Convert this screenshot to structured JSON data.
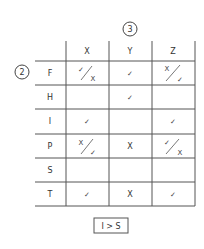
{
  "column_group_label": "3",
  "row_group_label": "2",
  "columns": [
    "X",
    "Y",
    "Z"
  ],
  "rows": [
    {
      "label": "F",
      "cells": [
        {
          "type": "split",
          "top": "✓",
          "bottom": "X"
        },
        {
          "type": "single",
          "value": "✓"
        },
        {
          "type": "split",
          "top": "X",
          "bottom": "✓"
        }
      ]
    },
    {
      "label": "H",
      "cells": [
        {
          "type": "empty"
        },
        {
          "type": "single",
          "value": "✓"
        },
        {
          "type": "empty"
        }
      ]
    },
    {
      "label": "I",
      "cells": [
        {
          "type": "single",
          "value": "✓"
        },
        {
          "type": "empty"
        },
        {
          "type": "single",
          "value": "✓"
        }
      ]
    },
    {
      "label": "P",
      "cells": [
        {
          "type": "split",
          "top": "X",
          "bottom": "✓"
        },
        {
          "type": "single",
          "value": "X"
        },
        {
          "type": "split",
          "top": "✓",
          "bottom": "X"
        }
      ]
    },
    {
      "label": "S",
      "cells": [
        {
          "type": "empty"
        },
        {
          "type": "empty"
        },
        {
          "type": "empty"
        }
      ]
    },
    {
      "label": "T",
      "cells": [
        {
          "type": "single",
          "value": "✓"
        },
        {
          "type": "single",
          "value": "X"
        },
        {
          "type": "single",
          "value": "✓"
        }
      ]
    }
  ],
  "conclusion": "I > S",
  "colors": {
    "line": "#555555",
    "text": "#333333",
    "background": "#ffffff"
  }
}
